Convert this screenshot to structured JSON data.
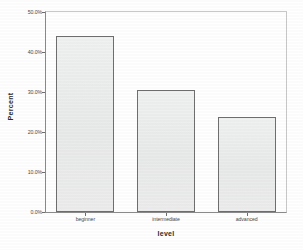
{
  "chart_data": {
    "type": "bar",
    "title": "",
    "subtitle": "",
    "xlabel": "level",
    "ylabel": "Percent",
    "categories": [
      "beginner",
      "intermediate",
      "advanced"
    ],
    "values": [
      44.0,
      30.6,
      23.7
    ],
    "value_labels": [
      "44.0%",
      "30.6%",
      "23.7%"
    ],
    "ylim": [
      0,
      50
    ],
    "ytick_values": [
      0,
      10,
      20,
      30,
      40,
      50
    ],
    "ytick_labels": [
      "0.0%",
      "10.0%",
      "20.0%",
      "30.0%",
      "40.0%",
      "50.0%"
    ],
    "grid": false,
    "legend": false,
    "legend_position": "none",
    "series": [
      {
        "name": "Percent",
        "values": [
          44.0,
          30.6,
          23.7
        ]
      }
    ],
    "colors": {
      "bar_fill": "#eceded",
      "bar_border": "#6f6f6f",
      "axis": "#8a8a8a",
      "frame": "#c8c8c8",
      "text": "#4a4a4a",
      "title_text": "#2b2b2b",
      "background": "#ffffff"
    }
  }
}
